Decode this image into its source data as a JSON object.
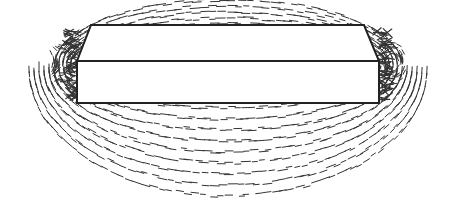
{
  "diagram": {
    "colors": {
      "background": "#ffffff",
      "outline": "#222222",
      "filings": "#333333"
    },
    "magnet": {
      "top_face": [
        [
          91,
          25
        ],
        [
          364,
          25
        ],
        [
          379,
          61
        ],
        [
          77,
          61
        ]
      ],
      "front_face": [
        [
          77,
          61
        ],
        [
          379,
          61
        ],
        [
          379,
          103
        ],
        [
          77,
          103
        ]
      ]
    },
    "poles": {
      "left": {
        "x": 77,
        "y": 64
      },
      "right": {
        "x": 379,
        "y": 64
      }
    }
  }
}
